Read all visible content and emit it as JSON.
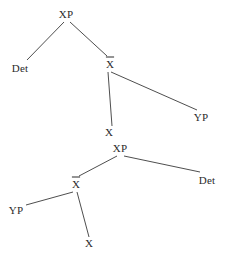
{
  "figure": {
    "background_color": "#ffffff",
    "line_color": "#3a3a3a",
    "text_color": "#2b2b2b",
    "width": 227,
    "height": 258
  },
  "trees": [
    {
      "id": "upper-tree",
      "name": "head-final-specifier-left",
      "nodes": [
        {
          "id": "u-xp",
          "label": "XP",
          "barred": false,
          "x": 66,
          "y": 14
        },
        {
          "id": "u-det",
          "label": "Det",
          "barred": false,
          "x": 20,
          "y": 68
        },
        {
          "id": "u-xbar",
          "label": "X",
          "barred": true,
          "x": 110,
          "y": 64
        },
        {
          "id": "u-x",
          "label": "X",
          "barred": false,
          "x": 109,
          "y": 132
        },
        {
          "id": "u-yp",
          "label": "YP",
          "barred": false,
          "x": 201,
          "y": 117
        }
      ],
      "edges": [
        {
          "from": "u-xp",
          "to": "u-det",
          "x1": 64,
          "y1": 22,
          "x2": 27,
          "y2": 60
        },
        {
          "from": "u-xp",
          "to": "u-xbar",
          "x1": 70,
          "y1": 22,
          "x2": 107,
          "y2": 56
        },
        {
          "from": "u-xbar",
          "to": "u-x",
          "x1": 108,
          "y1": 72,
          "x2": 112,
          "y2": 126
        },
        {
          "from": "u-xbar",
          "to": "u-yp",
          "x1": 111,
          "y1": 72,
          "x2": 197,
          "y2": 110
        }
      ]
    },
    {
      "id": "lower-tree",
      "name": "head-final-specifier-right",
      "nodes": [
        {
          "id": "l-xp",
          "label": "XP",
          "barred": false,
          "x": 120,
          "y": 148
        },
        {
          "id": "l-xbar",
          "label": "X",
          "barred": true,
          "x": 76,
          "y": 184
        },
        {
          "id": "l-det",
          "label": "Det",
          "barred": false,
          "x": 207,
          "y": 180
        },
        {
          "id": "l-yp",
          "label": "YP",
          "barred": false,
          "x": 16,
          "y": 210
        },
        {
          "id": "l-x",
          "label": "X",
          "barred": false,
          "x": 89,
          "y": 243
        }
      ],
      "edges": [
        {
          "from": "l-xp",
          "to": "l-xbar",
          "x1": 117,
          "y1": 156,
          "x2": 79,
          "y2": 176
        },
        {
          "from": "l-xp",
          "to": "l-det",
          "x1": 124,
          "y1": 156,
          "x2": 200,
          "y2": 172
        },
        {
          "from": "l-xbar",
          "to": "l-yp",
          "x1": 73,
          "y1": 192,
          "x2": 26,
          "y2": 205
        },
        {
          "from": "l-xbar",
          "to": "l-x",
          "x1": 77,
          "y1": 192,
          "x2": 89,
          "y2": 237
        }
      ]
    }
  ]
}
